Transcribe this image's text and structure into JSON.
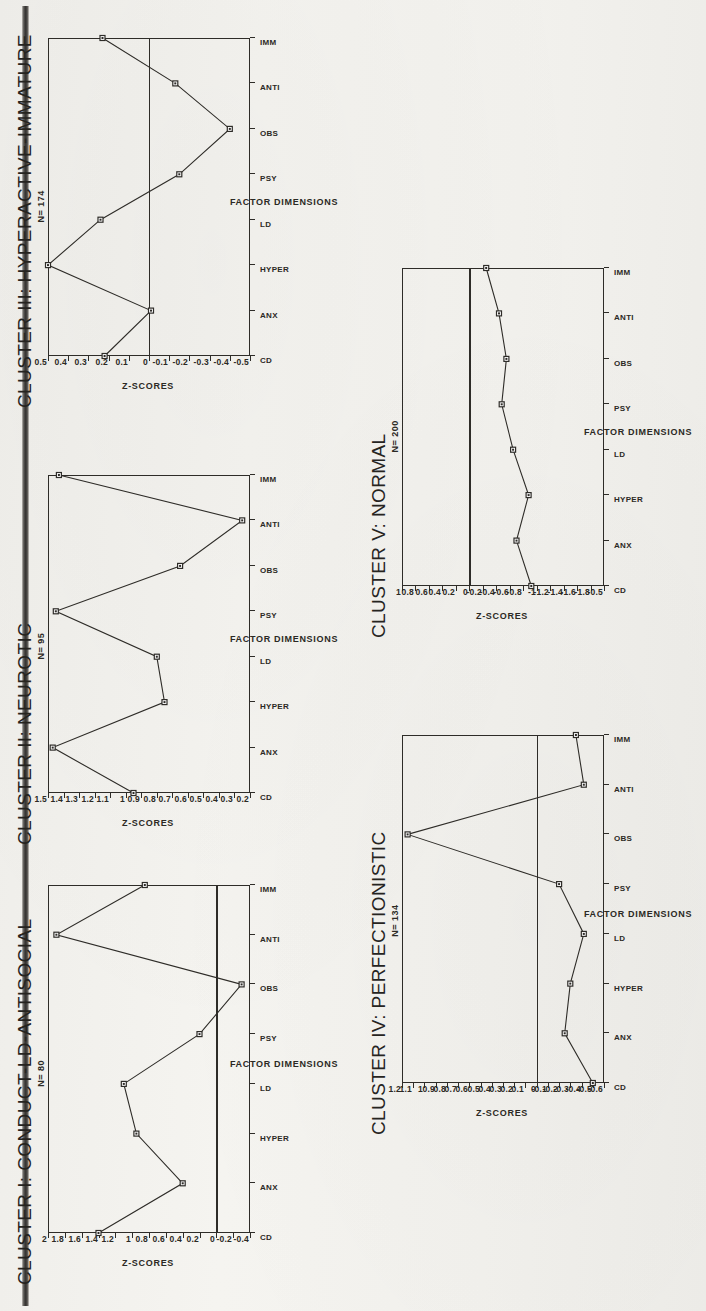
{
  "page": {
    "figure_kind": "multi-panel-line-charts",
    "shared_xlabel": "FACTOR DIMENSIONS",
    "shared_ylabel": "Z-SCORES",
    "categories": [
      "CD",
      "ANX",
      "HYPER",
      "LD",
      "PSY",
      "OBS",
      "ANTI",
      "IMM"
    ],
    "ink_color": "#2e2c28",
    "paper_color": "#f2f1ed"
  },
  "chart_data": [
    {
      "id": "cluster-1",
      "type": "line",
      "title": "CLUSTER I: CONDUCT-LD-ANTISOCIAL",
      "n_label": "N= 80",
      "n": 80,
      "xlabel": "FACTOR DIMENSIONS",
      "ylabel": "Z-SCORES",
      "categories": [
        "CD",
        "ANX",
        "HYPER",
        "LD",
        "PSY",
        "OBS",
        "ANTI",
        "IMM"
      ],
      "values": [
        1.4,
        0.4,
        0.95,
        1.1,
        0.2,
        -0.3,
        1.9,
        0.85
      ],
      "yticks": [
        "2",
        "1.8",
        "1.6",
        "1.4",
        "1.2",
        "1",
        "0.8",
        "0.6",
        "0.4",
        "0.2",
        "0",
        "-0.2",
        "-0.4"
      ],
      "ytickvals": [
        2,
        1.8,
        1.6,
        1.4,
        1.2,
        1,
        0.8,
        0.6,
        0.4,
        0.2,
        0,
        -0.2,
        -0.4
      ],
      "ylim": [
        -0.4,
        2.0
      ],
      "zero_reference_line": true,
      "grid": false,
      "legend": "none"
    },
    {
      "id": "cluster-2",
      "type": "line",
      "title": "CLUSTER II: NEUROTIC",
      "n_label": "N= 95",
      "n": 95,
      "xlabel": "FACTOR DIMENSIONS",
      "ylabel": "Z-SCORES",
      "categories": [
        "CD",
        "ANX",
        "HYPER",
        "LD",
        "PSY",
        "OBS",
        "ANTI",
        "IMM"
      ],
      "values": [
        0.95,
        1.47,
        0.75,
        0.8,
        1.45,
        0.65,
        0.25,
        1.43
      ],
      "yticks": [
        "1.5",
        "1.4",
        "1.3",
        "1.2",
        "1.1",
        "1",
        "0.9",
        "0.8",
        "0.7",
        "0.6",
        "0.5",
        "0.4",
        "0.3",
        "0.2"
      ],
      "ytickvals": [
        1.5,
        1.4,
        1.3,
        1.2,
        1.1,
        1,
        0.9,
        0.8,
        0.7,
        0.6,
        0.5,
        0.4,
        0.3,
        0.2
      ],
      "ylim": [
        0.2,
        1.5
      ],
      "zero_reference_line": false,
      "grid": false,
      "legend": "none"
    },
    {
      "id": "cluster-3",
      "type": "line",
      "title": "CLUSTER III: HYPERACTIVE-IMMATURE",
      "n_label": "N= 174",
      "n": 174,
      "xlabel": "FACTOR DIMENSIONS",
      "ylabel": "Z-SCORES",
      "categories": [
        "CD",
        "ANX",
        "HYPER",
        "LD",
        "PSY",
        "OBS",
        "ANTI",
        "IMM"
      ],
      "values": [
        0.22,
        -0.01,
        0.5,
        0.24,
        -0.15,
        -0.4,
        -0.13,
        0.23
      ],
      "yticks": [
        "0.5",
        "0.4",
        "0.3",
        "0.2",
        "0.1",
        "0",
        "-0.1",
        "-0.2",
        "-0.3",
        "-0.4",
        "-0.5"
      ],
      "ytickvals": [
        0.5,
        0.4,
        0.3,
        0.2,
        0.1,
        0,
        -0.1,
        -0.2,
        -0.3,
        -0.4,
        -0.5
      ],
      "ylim": [
        -0.5,
        0.5
      ],
      "zero_reference_line": true,
      "grid": false,
      "legend": "none"
    },
    {
      "id": "cluster-4",
      "type": "line",
      "title": "CLUSTER IV: PERFECTIONISTIC",
      "n_label": "N= 134",
      "n": 134,
      "xlabel": "FACTOR DIMENSIONS",
      "ylabel": "Z-SCORES",
      "categories": [
        "CD",
        "ANX",
        "HYPER",
        "LD",
        "PSY",
        "OBS",
        "ANTI",
        "IMM"
      ],
      "values": [
        -0.5,
        -0.25,
        -0.3,
        -0.42,
        -0.2,
        1.15,
        -0.42,
        -0.35
      ],
      "yticks": [
        "1.2",
        "1.1",
        "1",
        "0.9",
        "0.8",
        "0.7",
        "0.6",
        "0.5",
        "0.4",
        "0.3",
        "0.2",
        "0.1",
        "0",
        "-0.1",
        "-0.2",
        "-0.3",
        "-0.4",
        "-0.5",
        "-0.6"
      ],
      "ytickvals": [
        1.2,
        1.1,
        1,
        0.9,
        0.8,
        0.7,
        0.6,
        0.5,
        0.4,
        0.3,
        0.2,
        0.1,
        0,
        -0.1,
        -0.2,
        -0.3,
        -0.4,
        -0.5,
        -0.6
      ],
      "ylim": [
        -0.6,
        1.2
      ],
      "zero_reference_line": true,
      "grid": false,
      "legend": "none"
    },
    {
      "id": "cluster-5",
      "type": "line",
      "title": "CLUSTER V: NORMAL",
      "n_label": "N= 200",
      "n": 200,
      "xlabel": "FACTOR DIMENSIONS",
      "ylabel": "Z-SCORES",
      "categories": [
        "CD",
        "ANX",
        "HYPER",
        "LD",
        "PSY",
        "OBS",
        "ANTI",
        "IMM"
      ],
      "values": [
        -0.92,
        -0.7,
        -0.88,
        -0.65,
        -0.48,
        -0.55,
        -0.44,
        -0.25
      ],
      "yticks": [
        "1",
        "0.8",
        "0.6",
        "0.4",
        "0.2",
        "0",
        "-0.2",
        "-0.4",
        "-0.6",
        "-0.8",
        "-1",
        "-1.2",
        "-1.4",
        "-1.6",
        "-1.8",
        "-0.5"
      ],
      "ytickvals": [
        1,
        0.8,
        0.6,
        0.4,
        0.2,
        0,
        -0.2,
        -0.4,
        -0.6,
        -0.8,
        -1,
        -1.2,
        -1.4,
        -1.6,
        -1.8,
        -2
      ],
      "ylim": [
        -2.0,
        1.0
      ],
      "zero_reference_line": true,
      "grid": false,
      "legend": "none"
    }
  ]
}
